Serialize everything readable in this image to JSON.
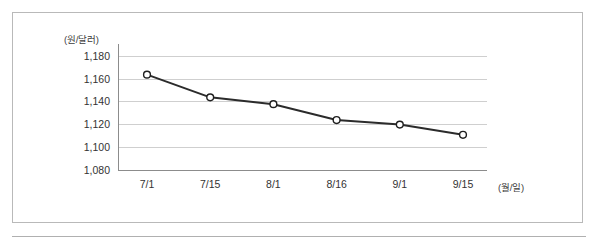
{
  "figure": {
    "frame_border_color": "#b9b9b9",
    "background_color": "#ffffff"
  },
  "chart_data": {
    "type": "line",
    "title": "",
    "subtitle": "",
    "xlabel": "(월/일)",
    "ylabel": "(원/달러)",
    "categories": [
      "7/1",
      "7/15",
      "8/1",
      "8/16",
      "9/1",
      "9/15"
    ],
    "values": [
      1164,
      1144,
      1138,
      1124,
      1120,
      1111
    ],
    "series": [
      {
        "name": "원/달러 환율",
        "values": [
          1164,
          1144,
          1138,
          1124,
          1120,
          1111
        ]
      }
    ],
    "ylim": [
      1080,
      1180
    ],
    "ytick_step": 20,
    "ytick_labels": [
      "1,180",
      "1,160",
      "1,140",
      "1,120",
      "1,100",
      "1,080"
    ],
    "ytick_values": [
      1180,
      1160,
      1140,
      1120,
      1100,
      1080
    ],
    "xtick_labels": [
      "7/1",
      "7/15",
      "8/1",
      "8/16",
      "9/1",
      "9/15"
    ],
    "grid": "horizontal",
    "grid_color": "#cfcfcf",
    "legend": "none",
    "legend_position": "none",
    "line_color": "#2b2b2b",
    "line_width": 2,
    "marker": "open-circle",
    "marker_face_color": "#ffffff",
    "marker_edge_color": "#1f1f1f",
    "axis_color": "#8c8c8c",
    "annotations": []
  }
}
